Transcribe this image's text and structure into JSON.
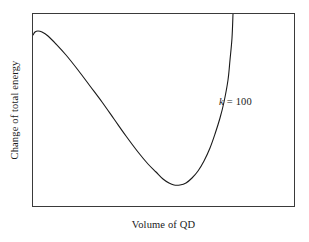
{
  "figure": {
    "background_color": "#ffffff",
    "frame_color": "#3a3a3a",
    "curve_color": "#1a1a1a"
  },
  "axes": {
    "xlabel": "Volume of QD",
    "ylabel": "Change of total energy"
  },
  "annotations": {
    "curve_label_symbol": "k",
    "curve_label_equals": " = ",
    "curve_label_value": "100"
  },
  "chart_data": {
    "type": "line",
    "title": "",
    "xlabel": "Volume of QD",
    "ylabel": "Change of total energy",
    "grid": false,
    "legend": false,
    "xlim": [
      0,
      1
    ],
    "ylim": [
      0,
      1
    ],
    "xticks": [],
    "yticks": [],
    "axis_tick_labels_shown": false,
    "annotations": [
      {
        "text": "k = 100",
        "x_frac": 0.715,
        "y_frac": 0.545,
        "italic_symbol": "k",
        "value": 100
      }
    ],
    "series": [
      {
        "name": "k = 100",
        "color": "#1a1a1a",
        "linewidth": 1,
        "description": "Change of total energy versus quantum-dot volume: rises to a small local maximum near zero volume, falls to a deep minimum, then rises steeply off the top of the frame.",
        "features": {
          "local_maximum": {
            "x_frac": 0.023,
            "y_frac": 0.907
          },
          "minimum": {
            "x_frac": 0.532,
            "y_frac": 0.113
          },
          "left_edge_start": {
            "x_frac": 0.004,
            "y_frac": 0.892
          },
          "exits_top_at": {
            "x_frac": 0.76,
            "y_frac": 1.0
          }
        },
        "points_px": [
          [
            33,
            35
          ],
          [
            35,
            32
          ],
          [
            38,
            31
          ],
          [
            42,
            32
          ],
          [
            48,
            36
          ],
          [
            56,
            44
          ],
          [
            66,
            55
          ],
          [
            78,
            70
          ],
          [
            90,
            86
          ],
          [
            102,
            102
          ],
          [
            114,
            119
          ],
          [
            126,
            136
          ],
          [
            138,
            152
          ],
          [
            148,
            164
          ],
          [
            156,
            172
          ],
          [
            163,
            179
          ],
          [
            169,
            183
          ],
          [
            174,
            185
          ],
          [
            180,
            185
          ],
          [
            186,
            183
          ],
          [
            192,
            178
          ],
          [
            198,
            171
          ],
          [
            204,
            161
          ],
          [
            210,
            148
          ],
          [
            215,
            134
          ],
          [
            220,
            118
          ],
          [
            224,
            102
          ],
          [
            228,
            80
          ],
          [
            230,
            60
          ],
          [
            232,
            38
          ],
          [
            233,
            14
          ]
        ]
      }
    ]
  }
}
